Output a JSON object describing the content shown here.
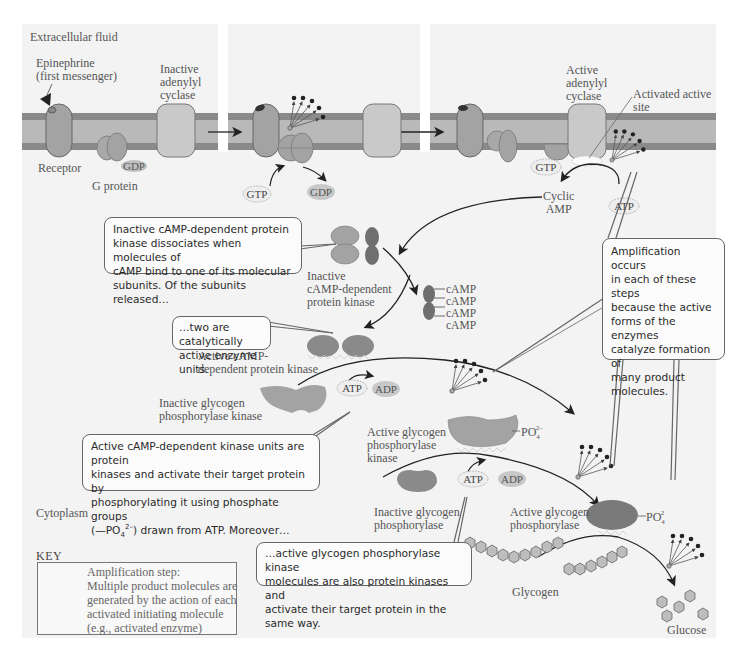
{
  "figure": {
    "regions": {
      "extracellular": "Extracellular fluid",
      "cytoplasm": "Cytoplasm"
    },
    "panel1": {
      "first_messenger": [
        "Epinephrine",
        "(first messenger)"
      ],
      "inactive_adenylyl_cyclase": [
        "Inactive",
        "adenylyl",
        "cyclase"
      ],
      "receptor": "Receptor",
      "g_protein": "G protein",
      "gdp": "GDP"
    },
    "panel2": {
      "gtp": "GTP",
      "gdp": "GDP"
    },
    "panel3": {
      "active_adenylyl_cyclase": [
        "Active",
        "adenylyl",
        "cyclase"
      ],
      "activated_active_site": [
        "Activated active",
        "site"
      ],
      "gtp": "GTP",
      "cyclic_amp": [
        "Cyclic",
        "AMP"
      ],
      "atp": "ATP"
    },
    "pathway": {
      "inactive_pka": [
        "Inactive",
        "cAMP-dependent",
        "protein kinase"
      ],
      "camp_list": [
        "cAMP",
        "cAMP",
        "cAMP",
        "cAMP"
      ],
      "active_pka": [
        "Active cAMP-",
        "dependent protein kinase"
      ],
      "atp_1": "ATP",
      "adp_1": "ADP",
      "inactive_gpk": [
        "Inactive glycogen",
        "phosphorylase kinase"
      ],
      "active_gpk": [
        "Active glycogen",
        "phosphorylase",
        "kinase"
      ],
      "po4_1": "PO",
      "po4_1_sub": "4",
      "po4_1_sup": "2–",
      "atp_2": "ATP",
      "adp_2": "ADP",
      "inactive_gp": [
        "Inactive glycogen",
        "phosphorylase"
      ],
      "active_gp": [
        "Active glycogen",
        "phosphorylase"
      ],
      "po4_2": "PO",
      "po4_2_sub": "4",
      "po4_2_sup": "2",
      "glycogen": "Glycogen",
      "glucose": "Glucose"
    },
    "callouts": {
      "dissociate": [
        "Inactive cAMP-dependent protein",
        "kinase dissociates when molecules of",
        "cAMP bind to one of its molecular",
        "subunits. Of the subunits released…"
      ],
      "two_active": [
        "…two are catalytically",
        "active enzyme units."
      ],
      "amplification": [
        "Amplification occurs",
        "in each of these steps",
        "because the active",
        "forms of the enzymes",
        "catalyze formation of",
        "many product",
        "molecules."
      ],
      "kinase_units": [
        "Active cAMP-dependent kinase units are protein",
        "kinases and activate their target protein by",
        "phosphorylating it using phosphate groups",
        "(—PO",
        "4",
        "2–",
        ") drawn from ATP. Moreover…"
      ],
      "also_kinases": [
        "…active glycogen phosphorylase kinase",
        "molecules are also protein kinases and",
        "activate their target protein in the same way."
      ]
    },
    "key": {
      "title": "KEY",
      "lines": [
        "Amplification step:",
        "Multiple product molecules are",
        "generated by the action of each",
        "activated initiating molecule",
        "(e.g., activated enzyme)"
      ]
    },
    "colors": {
      "background": "#f3f3f3",
      "membrane_dark": "#8a8a8a",
      "membrane_light": "#b9b9b9",
      "protein_mid": "#a3a3a3",
      "protein_dark": "#7a7a7a",
      "cyclase_light": "#c9c9c9",
      "callout_border": "#666666"
    }
  }
}
